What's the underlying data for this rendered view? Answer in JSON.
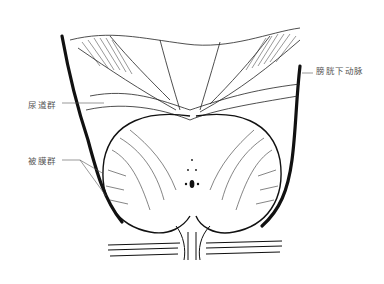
{
  "figure": {
    "labels": {
      "inferior_vesical_artery": "膀胱下动脉",
      "urethral_group": "尿道群",
      "capsular_group": "被膜群"
    },
    "colors": {
      "ink": "#111111",
      "label_text": "#555555",
      "background": "#ffffff"
    }
  }
}
